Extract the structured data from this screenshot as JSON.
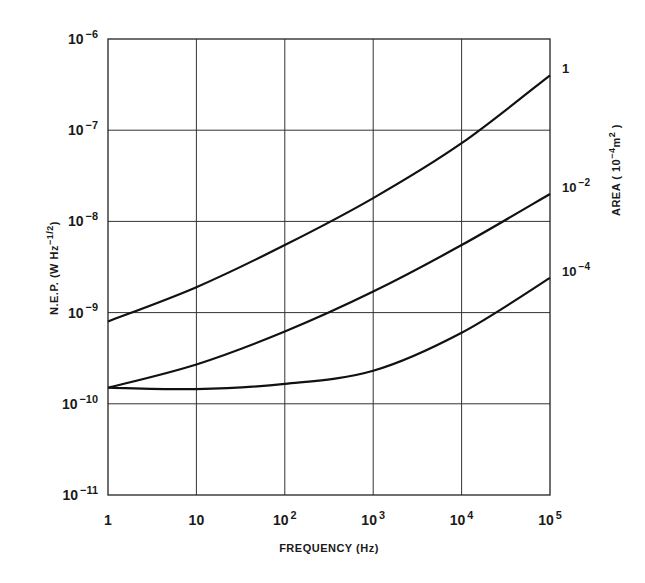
{
  "chart_data": {
    "type": "line",
    "title": "",
    "xlabel": "FREQUENCY (Hz)",
    "ylabel": "N.E.P. (W Hz^-1/2)",
    "right_label": "AREA (10^-4 m^2)",
    "xscale": "log",
    "yscale": "log",
    "xlim": [
      1,
      100000
    ],
    "ylim": [
      1e-11,
      1e-06
    ],
    "grid": true,
    "x_ticks": [
      {
        "base": "1",
        "exp": ""
      },
      {
        "base": "10",
        "exp": ""
      },
      {
        "base": "10",
        "exp": "2"
      },
      {
        "base": "10",
        "exp": "3"
      },
      {
        "base": "10",
        "exp": "4"
      },
      {
        "base": "10",
        "exp": "5"
      }
    ],
    "y_ticks": [
      {
        "base": "10",
        "exp": "-6"
      },
      {
        "base": "10",
        "exp": "-7"
      },
      {
        "base": "10",
        "exp": "-8"
      },
      {
        "base": "10",
        "exp": "-9"
      },
      {
        "base": "10",
        "exp": "-10"
      },
      {
        "base": "10",
        "exp": "-11"
      }
    ],
    "x": [
      1,
      10,
      100,
      1000,
      10000,
      100000
    ],
    "series": [
      {
        "name": "1",
        "label_base": "1",
        "label_exp": "",
        "values": [
          8e-10,
          1.9e-09,
          5.5e-09,
          1.8e-08,
          7.2e-08,
          4e-07
        ]
      },
      {
        "name": "10^-2",
        "label_base": "10",
        "label_exp": "-2",
        "values": [
          1.5e-10,
          2.7e-10,
          6.2e-10,
          1.7e-09,
          5.5e-09,
          2e-08
        ]
      },
      {
        "name": "10^-4",
        "label_base": "10",
        "label_exp": "-4",
        "values": [
          1.5e-10,
          1.45e-10,
          1.65e-10,
          2.3e-10,
          6e-10,
          2.4e-09
        ]
      }
    ],
    "legend": "curve labels at right end; series keyed by detector AREA (10^-4 m^2)"
  }
}
